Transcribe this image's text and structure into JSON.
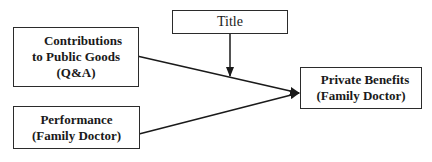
{
  "diagram": {
    "nodes": {
      "contributions": {
        "line1": "Contributions",
        "line2": "to Public Goods",
        "line3": "(Q&A)"
      },
      "performance": {
        "line1": "Performance",
        "line2": "(Family Doctor)"
      },
      "title": {
        "label": "Title"
      },
      "private_benefits": {
        "line1": "Private Benefits",
        "line2": "(Family Doctor)"
      }
    },
    "edges": [
      {
        "from": "contributions",
        "to": "private_benefits"
      },
      {
        "from": "performance",
        "to": "private_benefits"
      },
      {
        "from": "title",
        "to": "contributions->private_benefits edge (moderator)"
      }
    ],
    "colors": {
      "stroke": "#2b2b2b",
      "background": "#ffffff"
    }
  }
}
